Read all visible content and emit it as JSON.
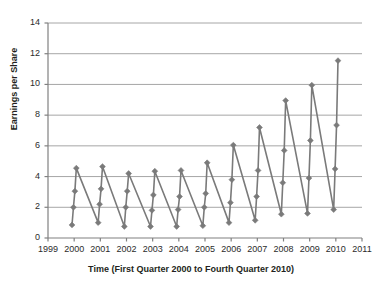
{
  "chart_data": {
    "type": "line",
    "title": "",
    "xlabel": "Time (First Quarter 2000 to Fourth Quarter 2010)",
    "ylabel": "Earnings per Share",
    "xlim": [
      1999,
      2011
    ],
    "ylim": [
      0,
      14
    ],
    "xticks": [
      "1999",
      "2000",
      "2001",
      "2002",
      "2003",
      "2004",
      "2005",
      "2006",
      "2007",
      "2008",
      "2009",
      "2010",
      "2011"
    ],
    "yticks": [
      "0",
      "2",
      "4",
      "6",
      "8",
      "10",
      "12",
      "14"
    ],
    "grid": "horizontal",
    "legend": "none",
    "marker": "diamond",
    "series_color": "#7a7a7a",
    "grid_color": "#a6a6a6",
    "axis_color": "#808080",
    "series": [
      {
        "name": "Earnings per Share",
        "x_labels": [
          "Q1 2000",
          "Q2 2000",
          "Q3 2000",
          "Q4 2000",
          "Q1 2001",
          "Q2 2001",
          "Q3 2001",
          "Q4 2001",
          "Q1 2002",
          "Q2 2002",
          "Q3 2002",
          "Q4 2002",
          "Q1 2003",
          "Q2 2003",
          "Q3 2003",
          "Q4 2003",
          "Q1 2004",
          "Q2 2004",
          "Q3 2004",
          "Q4 2004",
          "Q1 2005",
          "Q2 2005",
          "Q3 2005",
          "Q4 2005",
          "Q1 2006",
          "Q2 2006",
          "Q3 2006",
          "Q4 2006",
          "Q1 2007",
          "Q2 2007",
          "Q3 2007",
          "Q4 2007",
          "Q1 2008",
          "Q2 2008",
          "Q3 2008",
          "Q4 2008",
          "Q1 2009",
          "Q2 2009",
          "Q3 2009",
          "Q4 2009",
          "Q1 2010",
          "Q2 2010",
          "Q3 2010",
          "Q4 2010"
        ],
        "x": [
          2000.0,
          2000.0,
          2000.0,
          2000.0,
          2001.0,
          2001.0,
          2001.0,
          2001.0,
          2002.0,
          2002.0,
          2002.0,
          2002.0,
          2003.0,
          2003.0,
          2003.0,
          2003.0,
          2004.0,
          2004.0,
          2004.0,
          2004.0,
          2005.0,
          2005.0,
          2005.0,
          2005.0,
          2006.0,
          2006.0,
          2006.0,
          2006.0,
          2007.0,
          2007.0,
          2007.0,
          2007.0,
          2008.0,
          2008.0,
          2008.0,
          2008.0,
          2009.0,
          2009.0,
          2009.0,
          2009.0,
          2010.0,
          2010.0,
          2010.0,
          2010.0
        ],
        "values": [
          0.85,
          2.0,
          3.05,
          4.55,
          1.0,
          2.2,
          3.2,
          4.65,
          0.75,
          2.0,
          3.05,
          4.2,
          0.75,
          1.8,
          2.8,
          4.35,
          0.75,
          1.85,
          2.7,
          4.4,
          0.8,
          2.0,
          2.9,
          4.9,
          1.0,
          2.3,
          3.8,
          6.05,
          1.15,
          2.7,
          4.4,
          7.2,
          1.55,
          3.6,
          5.7,
          8.95,
          1.6,
          3.9,
          6.35,
          9.95,
          1.85,
          4.5,
          7.35,
          11.55
        ]
      }
    ]
  }
}
